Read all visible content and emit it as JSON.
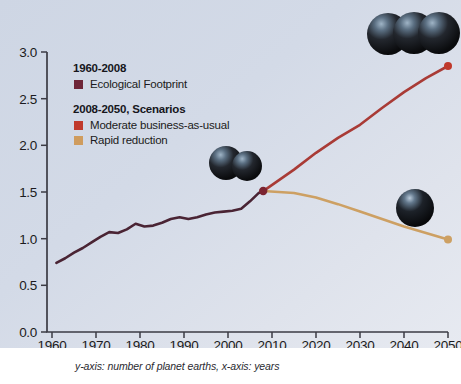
{
  "caption": "y-axis: number of planet earths, x-axis: years",
  "legend": {
    "heading_historical": "1960-2008",
    "heading_scenarios": "2008-2050, Scenarios",
    "items": [
      {
        "label": "Ecological Footprint",
        "color": "#6e2538"
      },
      {
        "label": "Moderate business-as-usual",
        "color": "#c0392b"
      },
      {
        "label": "Rapid reduction",
        "color": "#cf9c5e"
      }
    ]
  },
  "colors": {
    "background_top_left": "#ced6e4",
    "background_bottom_right": "#e7eaf1",
    "historical_line": "#4a2434",
    "moderate_line": "#a93b36",
    "rapid_line": "#cda063",
    "axis": "#3b3b44",
    "junction_marker": "#7b2430",
    "moderate_endpoint": "#c0392b",
    "rapid_endpoint": "#cda063"
  },
  "chart_data": {
    "type": "line",
    "title": "",
    "xlabel": "years",
    "ylabel": "number of planet earths",
    "xlim": [
      1960,
      2050
    ],
    "ylim": [
      0.0,
      3.0
    ],
    "xticks": [
      1960,
      1970,
      1980,
      1990,
      2000,
      2010,
      2020,
      2030,
      2040,
      2050
    ],
    "yticks": [
      "0.0",
      "0.5",
      "1.0",
      "1.5",
      "2.0",
      "2.5",
      "3.0"
    ],
    "grid": false,
    "legend_position": "upper-left",
    "series": [
      {
        "name": "Ecological Footprint",
        "period": "1960-2008",
        "color": "#4a2434",
        "x": [
          1961,
          1963,
          1965,
          1967,
          1969,
          1971,
          1973,
          1975,
          1977,
          1979,
          1981,
          1983,
          1985,
          1987,
          1989,
          1991,
          1993,
          1995,
          1997,
          1999,
          2001,
          2003,
          2005,
          2007,
          2008
        ],
        "values": [
          0.74,
          0.79,
          0.85,
          0.9,
          0.96,
          1.02,
          1.07,
          1.06,
          1.1,
          1.16,
          1.13,
          1.14,
          1.17,
          1.21,
          1.23,
          1.21,
          1.23,
          1.26,
          1.28,
          1.29,
          1.3,
          1.32,
          1.4,
          1.49,
          1.51
        ]
      },
      {
        "name": "Moderate business-as-usual",
        "period": "2008-2050",
        "color": "#a93b36",
        "x": [
          2008,
          2015,
          2020,
          2025,
          2030,
          2035,
          2040,
          2045,
          2050
        ],
        "values": [
          1.51,
          1.74,
          1.92,
          2.08,
          2.22,
          2.4,
          2.57,
          2.72,
          2.85
        ]
      },
      {
        "name": "Rapid reduction",
        "period": "2008-2050",
        "color": "#cda063",
        "x": [
          2008,
          2015,
          2020,
          2025,
          2030,
          2035,
          2040,
          2045,
          2050
        ],
        "values": [
          1.51,
          1.49,
          1.44,
          1.37,
          1.29,
          1.21,
          1.13,
          1.06,
          0.99
        ]
      }
    ],
    "markers": [
      {
        "name": "branch-point",
        "x": 2008,
        "y": 1.51,
        "color": "#7b2430"
      },
      {
        "name": "moderate-endpoint",
        "x": 2050,
        "y": 2.85,
        "color": "#c0392b"
      },
      {
        "name": "rapid-endpoint",
        "x": 2050,
        "y": 0.99,
        "color": "#cda063"
      }
    ],
    "globe_annotations": [
      {
        "name": "globes-three-2050",
        "count": 3,
        "near_x": 2050,
        "near_y": 3.0
      },
      {
        "name": "globes-two-2008",
        "count": 2,
        "near_x": 2008,
        "near_y": 1.8
      },
      {
        "name": "globe-one-2050",
        "count": 1,
        "near_x": 2048,
        "near_y": 1.25
      }
    ]
  }
}
